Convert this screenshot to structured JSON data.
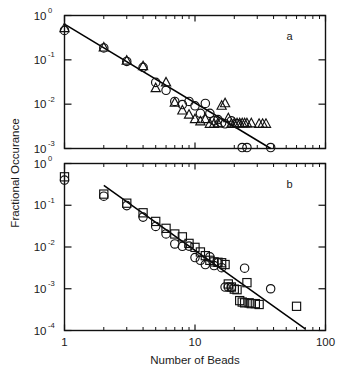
{
  "figure": {
    "title": "",
    "background": "#ffffff",
    "ink_color": "#111111",
    "y_axis_title": "Fractional Occurance",
    "x_axis_title": "Number of Beads"
  },
  "panels": {
    "a": {
      "letter": "a"
    },
    "b": {
      "letter": "b"
    }
  },
  "labels": {
    "x_1": "1",
    "x_10": "10",
    "x_100": "100",
    "y_mantissa": "10",
    "exp_0": "0",
    "exp_m1": "-1",
    "exp_m2": "-2",
    "exp_m3": "-3",
    "exp_m4": "-4"
  },
  "chart_data": [
    {
      "id": "panel-a",
      "type": "scatter",
      "title": "a",
      "xlabel": "Number of Beads",
      "ylabel": "Fractional Occurance",
      "xscale": "log",
      "yscale": "log",
      "xlim": [
        1,
        100
      ],
      "ylim": [
        0.001,
        1
      ],
      "xticks": [
        1,
        10,
        100
      ],
      "xticklabels": [
        "1",
        "10",
        "100"
      ],
      "yticks": [
        1,
        0.1,
        0.01,
        0.001
      ],
      "yticklabels": [
        "10 0",
        "10 -1",
        "10 -2",
        "10 -3"
      ],
      "grid": false,
      "legend": null,
      "series": [
        {
          "name": "circles",
          "marker": "circle",
          "points": [
            [
              1,
              0.46
            ],
            [
              2,
              0.185
            ],
            [
              3,
              0.092
            ],
            [
              4,
              0.068
            ],
            [
              5,
              0.031
            ],
            [
              6,
              0.0205
            ],
            [
              7,
              0.0115
            ],
            [
              8,
              0.0098
            ],
            [
              9,
              0.0115
            ],
            [
              10,
              0.0092
            ],
            [
              11,
              0.0062
            ],
            [
              12,
              0.0104
            ],
            [
              13,
              0.0062
            ],
            [
              14,
              0.0042
            ],
            [
              15,
              0.0045
            ],
            [
              16,
              0.0038
            ],
            [
              17,
              0.0036
            ],
            [
              19,
              0.0042
            ],
            [
              21,
              0.0036
            ],
            [
              23,
              0.001
            ],
            [
              25,
              0.001
            ],
            [
              38,
              0.001
            ]
          ]
        },
        {
          "name": "triangles",
          "marker": "triangle",
          "points": [
            [
              1,
              0.52
            ],
            [
              2,
              0.19
            ],
            [
              3,
              0.096
            ],
            [
              4,
              0.072
            ],
            [
              5,
              0.023
            ],
            [
              6,
              0.031
            ],
            [
              7,
              0.0108
            ],
            [
              8,
              0.0072
            ],
            [
              9,
              0.0058
            ],
            [
              10,
              0.0046
            ],
            [
              11,
              0.0041
            ],
            [
              12,
              0.0046
            ],
            [
              13,
              0.0036
            ],
            [
              14,
              0.0036
            ],
            [
              15,
              0.0037
            ],
            [
              16,
              0.0092
            ],
            [
              17,
              0.0105
            ],
            [
              18,
              0.0048
            ],
            [
              19,
              0.0036
            ],
            [
              20,
              0.0037
            ],
            [
              21,
              0.0037
            ],
            [
              22,
              0.0037
            ],
            [
              23,
              0.0037
            ],
            [
              24,
              0.0037
            ],
            [
              25,
              0.0037
            ],
            [
              27,
              0.0037
            ],
            [
              31,
              0.0036
            ],
            [
              33,
              0.0036
            ],
            [
              35,
              0.0036
            ]
          ]
        }
      ],
      "fit_line": {
        "x": [
          1,
          38
        ],
        "y": [
          0.64,
          0.00098
        ],
        "slope_decades": -2.81
      }
    },
    {
      "id": "panel-b",
      "type": "scatter",
      "title": "b",
      "xlabel": "Number of Beads",
      "ylabel": "Fractional Occurance",
      "xscale": "log",
      "yscale": "log",
      "xlim": [
        1,
        100
      ],
      "ylim": [
        0.0001,
        1
      ],
      "xticks": [
        1,
        10,
        100
      ],
      "xticklabels": [
        "1",
        "10",
        "100"
      ],
      "yticks": [
        1,
        0.1,
        0.01,
        0.001,
        0.0001
      ],
      "yticklabels": [
        "10 0",
        "10 -1",
        "10 -2",
        "10 -3",
        "10 -4"
      ],
      "grid": false,
      "legend": null,
      "series": [
        {
          "name": "squares",
          "marker": "square",
          "points": [
            [
              1,
              0.48
            ],
            [
              2,
              0.185
            ],
            [
              3,
              0.112
            ],
            [
              4,
              0.066
            ],
            [
              5,
              0.041
            ],
            [
              6,
              0.028
            ],
            [
              7,
              0.0205
            ],
            [
              8,
              0.0175
            ],
            [
              9,
              0.0122
            ],
            [
              10,
              0.0098
            ],
            [
              11,
              0.0076
            ],
            [
              12,
              0.0062
            ],
            [
              13,
              0.0048
            ],
            [
              14,
              0.0044
            ],
            [
              15,
              0.0043
            ],
            [
              16,
              0.0042
            ],
            [
              17,
              0.0038
            ],
            [
              18,
              0.0013
            ],
            [
              19,
              0.0011
            ],
            [
              20,
              0.00098
            ],
            [
              21,
              0.00095
            ],
            [
              22,
              0.00052
            ],
            [
              23,
              0.00048
            ],
            [
              24,
              0.00046
            ],
            [
              25,
              0.0014
            ],
            [
              26,
              0.00046
            ],
            [
              27,
              0.00044
            ],
            [
              29,
              0.00044
            ],
            [
              31,
              0.00042
            ],
            [
              60,
              0.00038
            ]
          ]
        },
        {
          "name": "circles",
          "marker": "circle",
          "points": [
            [
              1,
              0.4
            ],
            [
              2,
              0.165
            ],
            [
              3,
              0.098
            ],
            [
              4,
              0.052
            ],
            [
              5,
              0.031
            ],
            [
              6,
              0.0205
            ],
            [
              7,
              0.0118
            ],
            [
              8,
              0.0104
            ],
            [
              9,
              0.0105
            ],
            [
              10,
              0.0056
            ],
            [
              11,
              0.0048
            ],
            [
              12,
              0.0038
            ],
            [
              13,
              0.0058
            ],
            [
              14,
              0.0036
            ],
            [
              15,
              0.0042
            ],
            [
              16,
              0.0032
            ],
            [
              17,
              0.0011
            ],
            [
              18,
              0.0011
            ],
            [
              19,
              0.00108
            ],
            [
              24,
              0.0031
            ],
            [
              38,
              0.001
            ]
          ]
        }
      ],
      "fit_line": {
        "x": [
          2,
          70
        ],
        "y": [
          0.3,
          0.00011
        ],
        "slope_decades": -2.26
      }
    }
  ]
}
